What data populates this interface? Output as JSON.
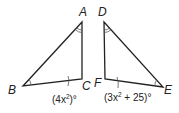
{
  "diagram": {
    "type": "congruent-triangles",
    "triangles": [
      {
        "name": "triangle-ABC",
        "vertices": [
          {
            "label": "A",
            "x": 82,
            "y": 22
          },
          {
            "label": "B",
            "x": 23,
            "y": 86
          },
          {
            "label": "C",
            "x": 82,
            "y": 79
          }
        ],
        "angle_C_expression": {
          "prefix": "(4x",
          "exp": "2",
          "suffix": ")°"
        }
      },
      {
        "name": "triangle-DEF",
        "vertices": [
          {
            "label": "D",
            "x": 104,
            "y": 22
          },
          {
            "label": "F",
            "x": 105,
            "y": 79
          },
          {
            "label": "E",
            "x": 163,
            "y": 87
          }
        ],
        "angle_F_expression": {
          "prefix": "(3x",
          "exp": "2",
          "suffix": " + 25)°"
        }
      }
    ],
    "markings": {
      "double_arc": [
        "A",
        "D"
      ],
      "single_arc": [
        "B",
        "E"
      ],
      "tick_mark_angle": [
        "C",
        "F"
      ]
    },
    "colors": {
      "stroke": "#222222",
      "background": "#ffffff"
    }
  }
}
